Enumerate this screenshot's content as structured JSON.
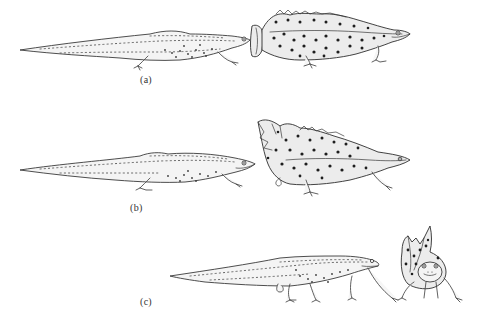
{
  "figure": {
    "background_color": "#ffffff",
    "line_color": "#3a3a3a",
    "spot_color": "#1e1e1e"
  },
  "panels": [
    {
      "id": "a",
      "label": "(a)",
      "description": "Newt emerging forward; old spotted skin pulled back over front half, shed skin bunched behind head"
    },
    {
      "id": "b",
      "label": "(b)",
      "description": "Newt fully out of old skin on left; shed spotted skin on right with crumpled rear end"
    },
    {
      "id": "c",
      "label": "(c)",
      "description": "Newt walking forward while shed skin bunched at head, frontal view of shed skin casing"
    }
  ]
}
